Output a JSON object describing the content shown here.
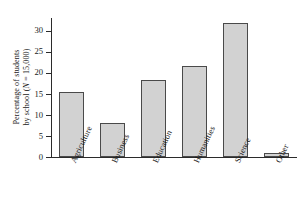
{
  "chart_data": {
    "type": "bar",
    "title": "",
    "xlabel": "",
    "ylabel": "Percentage of students by school (N = 15,000)",
    "ylabel_line1": "Percentage of students",
    "ylabel_line2_pre": "by school (",
    "ylabel_line2_italic": "N",
    "ylabel_line2_post": " = 15,000)",
    "categories": [
      "Agriculture",
      "Business",
      "Education",
      "Humanities",
      "Science",
      "Other"
    ],
    "values": [
      15.5,
      8.1,
      18.2,
      21.7,
      31.8,
      1.0
    ],
    "ylim": [
      0,
      33
    ],
    "yticks": [
      0,
      5,
      10,
      15,
      20,
      25,
      30
    ],
    "ytick_labels": [
      "0",
      "5",
      "10",
      "15",
      "20",
      "25",
      "30"
    ],
    "grid": false,
    "legend": "none",
    "bar_fill_color": "#d2d2d2",
    "bar_edge_color": "#4a4a4a",
    "axis_color": "#2b2b2b",
    "background_color": "#ffffff"
  }
}
